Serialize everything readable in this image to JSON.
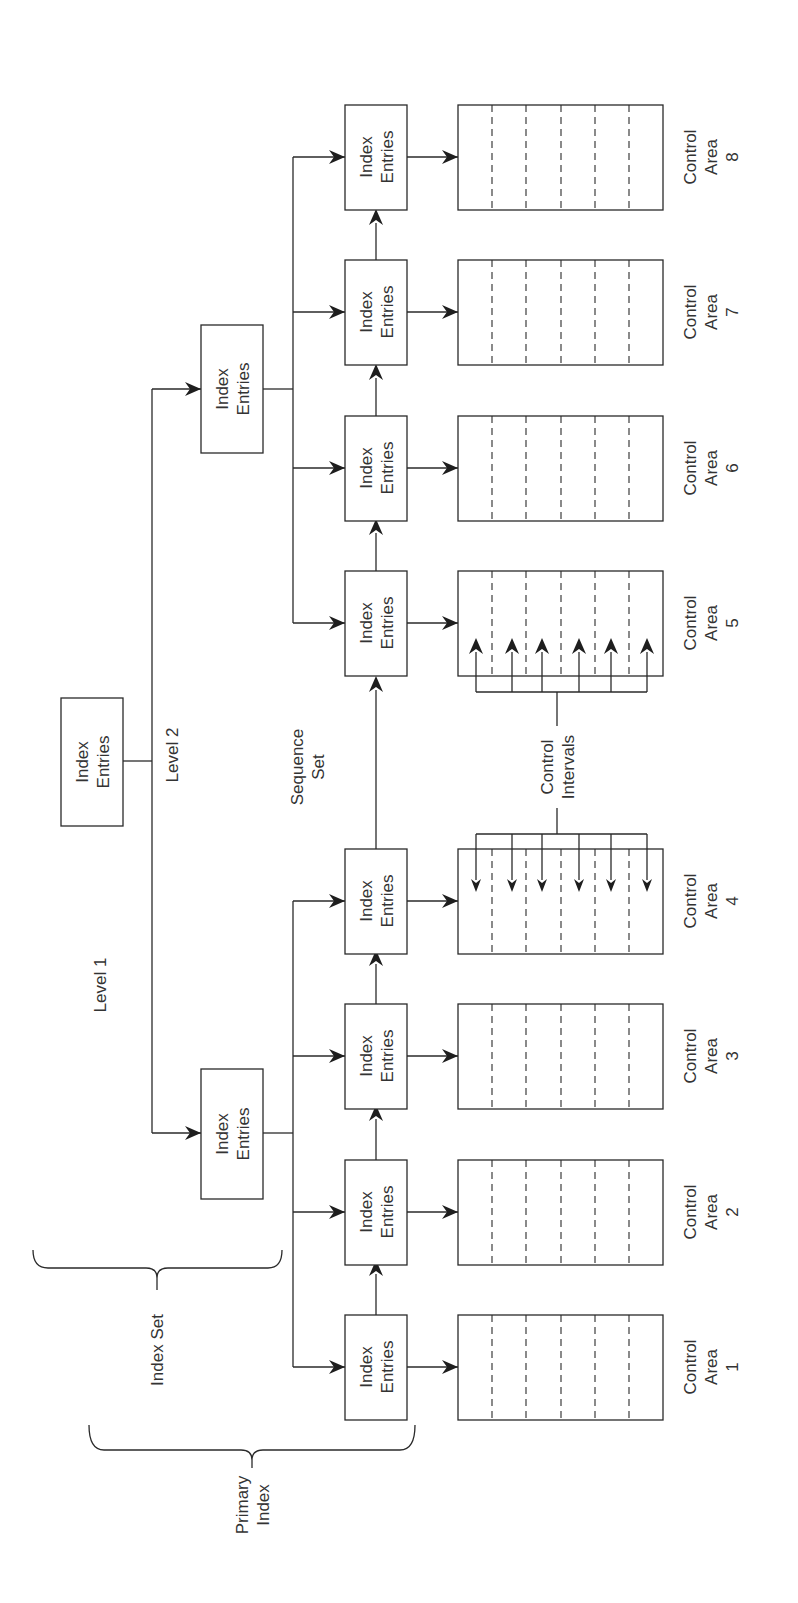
{
  "diagram": {
    "level2": {
      "label": "Level 2",
      "box": {
        "line1": "Index",
        "line2": "Entries"
      }
    },
    "level1": {
      "label": "Level 1",
      "boxes": [
        {
          "line1": "Index",
          "line2": "Entries"
        },
        {
          "line1": "Index",
          "line2": "Entries"
        }
      ]
    },
    "sequence_set": {
      "label_line1": "Sequence",
      "label_line2": "Set",
      "boxes": [
        {
          "line1": "Index",
          "line2": "Entries"
        },
        {
          "line1": "Index",
          "line2": "Entries"
        },
        {
          "line1": "Index",
          "line2": "Entries"
        },
        {
          "line1": "Index",
          "line2": "Entries"
        },
        {
          "line1": "Index",
          "line2": "Entries"
        },
        {
          "line1": "Index",
          "line2": "Entries"
        },
        {
          "line1": "Index",
          "line2": "Entries"
        },
        {
          "line1": "Index",
          "line2": "Entries"
        }
      ]
    },
    "control_areas": [
      {
        "line1": "Control",
        "line2": "Area",
        "number": "1"
      },
      {
        "line1": "Control",
        "line2": "Area",
        "number": "2"
      },
      {
        "line1": "Control",
        "line2": "Area",
        "number": "3"
      },
      {
        "line1": "Control",
        "line2": "Area",
        "number": "4"
      },
      {
        "line1": "Control",
        "line2": "Area",
        "number": "5"
      },
      {
        "line1": "Control",
        "line2": "Area",
        "number": "6"
      },
      {
        "line1": "Control",
        "line2": "Area",
        "number": "7"
      },
      {
        "line1": "Control",
        "line2": "Area",
        "number": "8"
      }
    ],
    "control_intervals": {
      "line1": "Control",
      "line2": "Intervals"
    },
    "braces": {
      "index_set": "Index Set",
      "primary_index_line1": "Primary",
      "primary_index_line2": "Index"
    },
    "orientation": "rotated 90° counter-clockwise"
  }
}
